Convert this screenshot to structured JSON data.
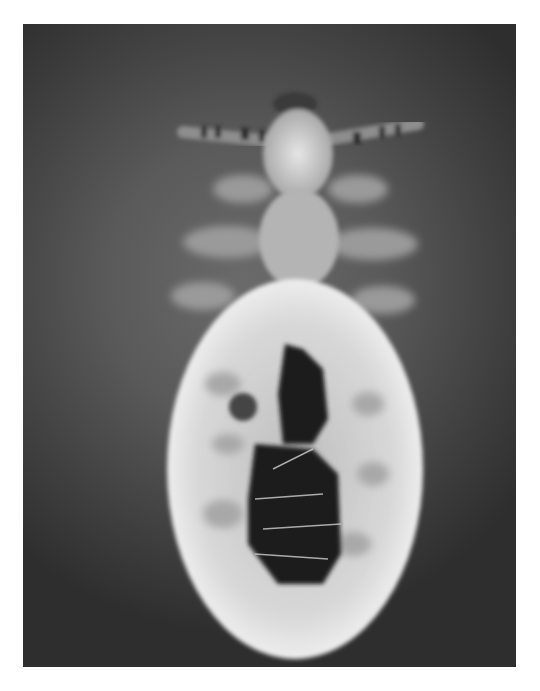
{
  "image": {
    "subject": "Head louse nymph, dorsal view, grayscale micrograph",
    "alt": "Grayscale micrograph of a louse showing head, six legs and translucent oval abdomen with dark gut contents",
    "colors": {
      "page_background": "#ffffff",
      "photo_background_light": "#6a6a6a",
      "photo_background_dark": "#2e2e2e",
      "body_highlight": "#e8e8e8",
      "gut_dark": "#1e1e1e"
    },
    "frame": {
      "left": 23,
      "top": 24,
      "width": 493,
      "height": 643
    }
  }
}
